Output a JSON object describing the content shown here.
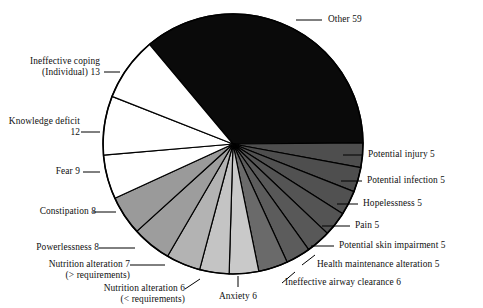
{
  "figure": {
    "width": 483,
    "height": 308,
    "background": "#ffffff",
    "outline_color": "#000000"
  },
  "chart_data": {
    "type": "pie",
    "title": "",
    "subtitle": "",
    "xlabel": "",
    "ylabel": "",
    "legend_position": "none",
    "grid": false,
    "total": 164,
    "units": "count",
    "start_angle_deg": -40,
    "direction": "clockwise",
    "categories": [
      "Other",
      "Potential injury",
      "Potential infection",
      "Hopelessness",
      "Pain",
      "Potential skin impairment",
      "Health maintenance alteration",
      "Ineffective airway clearance",
      "Anxiety",
      "Nutrition alteration (< requirements)",
      "Nutrition alteration (> requirements)",
      "Powerlessness",
      "Constipation",
      "Fear",
      "Knowledge deficit",
      "Ineffective coping (Individual)"
    ],
    "values": [
      59,
      5,
      5,
      5,
      5,
      5,
      5,
      6,
      6,
      6,
      7,
      8,
      8,
      9,
      12,
      13
    ],
    "colors": [
      "#0a0a0a",
      "#4e4e4e",
      "#4e4e4e",
      "#515151",
      "#545454",
      "#585858",
      "#5c5c5c",
      "#6a6a6a",
      "#c9c9c9",
      "#c4c4c4",
      "#b3b3b3",
      "#9d9d9d",
      "#9a9a9a",
      "#ffffff",
      "#ffffff",
      "#ffffff"
    ],
    "slices": [
      {
        "label": "Other",
        "value": 59,
        "color": "#0a0a0a"
      },
      {
        "label": "Potential injury",
        "value": 5,
        "color": "#4e4e4e"
      },
      {
        "label": "Potential infection",
        "value": 5,
        "color": "#4e4e4e"
      },
      {
        "label": "Hopelessness",
        "value": 5,
        "color": "#515151"
      },
      {
        "label": "Pain",
        "value": 5,
        "color": "#545454"
      },
      {
        "label": "Potential skin impairment",
        "value": 5,
        "color": "#585858"
      },
      {
        "label": "Health maintenance alteration",
        "value": 5,
        "color": "#5c5c5c"
      },
      {
        "label": "Ineffective airway clearance",
        "value": 6,
        "color": "#6a6a6a"
      },
      {
        "label": "Anxiety",
        "value": 6,
        "color": "#c9c9c9"
      },
      {
        "label": "Nutrition alteration (< requirements)",
        "value": 6,
        "color": "#c4c4c4"
      },
      {
        "label": "Nutrition alteration (> requirements)",
        "value": 7,
        "color": "#b3b3b3"
      },
      {
        "label": "Powerlessness",
        "value": 8,
        "color": "#9d9d9d"
      },
      {
        "label": "Constipation",
        "value": 8,
        "color": "#9a9a9a"
      },
      {
        "label": "Fear",
        "value": 9,
        "color": "#ffffff"
      },
      {
        "label": "Knowledge deficit",
        "value": 12,
        "color": "#ffffff"
      },
      {
        "label": "Ineffective coping (Individual)",
        "value": 13,
        "color": "#ffffff"
      }
    ]
  },
  "labels": {
    "other": {
      "text": "Other  59"
    },
    "ineffective_coping": {
      "line1": "Ineffective coping",
      "line2": "(Individual) 13"
    },
    "knowledge_deficit": {
      "line1": "Knowledge deficit",
      "line2": "12"
    },
    "fear": {
      "text": "Fear 9"
    },
    "constipation": {
      "text": "Constipation 8"
    },
    "powerlessness": {
      "text": "Powerlessness 8"
    },
    "nutrition_greater": {
      "line1": "Nutrition alteration 7",
      "line2": "(> requirements)"
    },
    "nutrition_less": {
      "line1": "Nutrition alteration 6",
      "line2": "(< requirements)"
    },
    "anxiety": {
      "text": "Anxiety 6"
    },
    "ineffective_airway": {
      "text": "Ineffective airway clearance 6"
    },
    "health_maintenance": {
      "text": "Health maintenance alteration 5"
    },
    "potential_skin": {
      "text": "Potential skin impairment 5"
    },
    "pain": {
      "text": "Pain 5"
    },
    "hopelessness": {
      "text": "Hopelessness 5"
    },
    "potential_infection": {
      "text": "Potential infection 5"
    },
    "potential_injury": {
      "text": "Potential injury 5"
    }
  }
}
